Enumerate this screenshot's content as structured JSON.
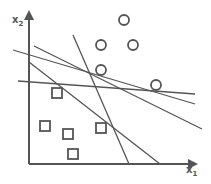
{
  "diagram": {
    "title": "",
    "x_axis_label": "x",
    "x_axis_subscript": "1",
    "y_axis_label": "x",
    "y_axis_subscript": "2",
    "colors": {
      "stroke": "#555555",
      "background": "#ffffff"
    },
    "axes": {
      "origin": [
        29,
        164
      ],
      "x_end": [
        196,
        164
      ],
      "y_end": [
        29,
        12
      ]
    },
    "circles": [
      {
        "cx": 124,
        "cy": 20,
        "r": 5
      },
      {
        "cx": 101,
        "cy": 45,
        "r": 5
      },
      {
        "cx": 133,
        "cy": 45,
        "r": 5
      },
      {
        "cx": 101,
        "cy": 70,
        "r": 5
      },
      {
        "cx": 156,
        "cy": 85,
        "r": 5
      }
    ],
    "squares": [
      {
        "x": 52,
        "y": 88,
        "size": 10
      },
      {
        "x": 40,
        "y": 121,
        "size": 10
      },
      {
        "x": 63,
        "y": 129,
        "size": 10
      },
      {
        "x": 96,
        "y": 123,
        "size": 10
      },
      {
        "x": 68,
        "y": 149,
        "size": 10
      }
    ],
    "lines": [
      {
        "x1": 73,
        "y1": 35,
        "x2": 129,
        "y2": 164
      },
      {
        "x1": 13,
        "y1": 50,
        "x2": 195,
        "y2": 104
      },
      {
        "x1": 34,
        "y1": 46,
        "x2": 202,
        "y2": 129
      },
      {
        "x1": 29,
        "y1": 62,
        "x2": 160,
        "y2": 164
      },
      {
        "x1": 18,
        "y1": 81,
        "x2": 195,
        "y2": 94
      }
    ]
  }
}
